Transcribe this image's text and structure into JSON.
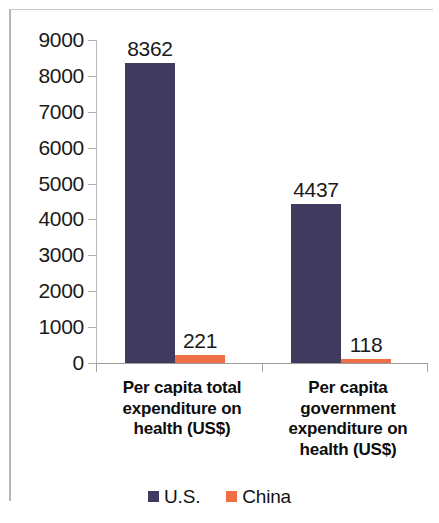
{
  "chart_data": {
    "type": "bar",
    "title": "",
    "subtitle": "",
    "xlabel": "",
    "ylabel": "",
    "ylim": [
      0,
      9000
    ],
    "ytick_step": 1000,
    "yticks": [
      "9000",
      "8000",
      "7000",
      "6000",
      "5000",
      "4000",
      "3000",
      "2000",
      "1000",
      "0"
    ],
    "grid": false,
    "legend_position": "bottom",
    "categories": [
      "Per capita total expenditure on health (US$)",
      "Per capita government expenditure on health (US$)"
    ],
    "category_lines": [
      [
        "Per capita total",
        "expenditure on",
        "health (US$)"
      ],
      [
        "Per capita",
        "government",
        "expenditure on",
        "health (US$)"
      ]
    ],
    "series": [
      {
        "name": "U.S.",
        "color": "#403a5e",
        "values": [
          8362,
          4437
        ],
        "labels": [
          "8362",
          "4437"
        ]
      },
      {
        "name": "China",
        "color": "#ef6f45",
        "values": [
          221,
          118
        ],
        "labels": [
          "221",
          "118"
        ]
      }
    ]
  },
  "legend": {
    "items": [
      {
        "label": "U.S.",
        "color": "#403a5e"
      },
      {
        "label": "China",
        "color": "#ef6f45"
      }
    ]
  },
  "colors": {
    "us": "#403a5e",
    "china": "#ef6f45",
    "axis": "#a8a8a8",
    "text": "#1a1a1a",
    "background": "#ffffff"
  }
}
